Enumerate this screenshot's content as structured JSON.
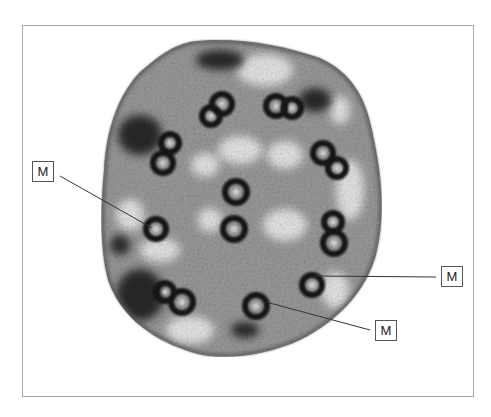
{
  "figure": {
    "colors": {
      "frame_border": "#a9a9a9",
      "background": "#ffffff",
      "dense_stain": "#1a1a1a",
      "cytoplasm": "#8a8a8a",
      "leader_line": "#333333"
    },
    "labels": [
      {
        "id": "label-left",
        "text": "M",
        "box": [
          32,
          161
        ],
        "line_from": [
          56,
          176
        ],
        "line_to": [
          152,
          228
        ]
      },
      {
        "id": "label-right",
        "text": "M",
        "box": [
          441,
          266
        ],
        "line_from": [
          441,
          276
        ],
        "line_to": [
          318,
          276
        ]
      },
      {
        "id": "label-bottom",
        "text": "M",
        "box": [
          375,
          319
        ],
        "line_from": [
          375,
          329
        ],
        "line_to": [
          270,
          300
        ]
      }
    ]
  }
}
